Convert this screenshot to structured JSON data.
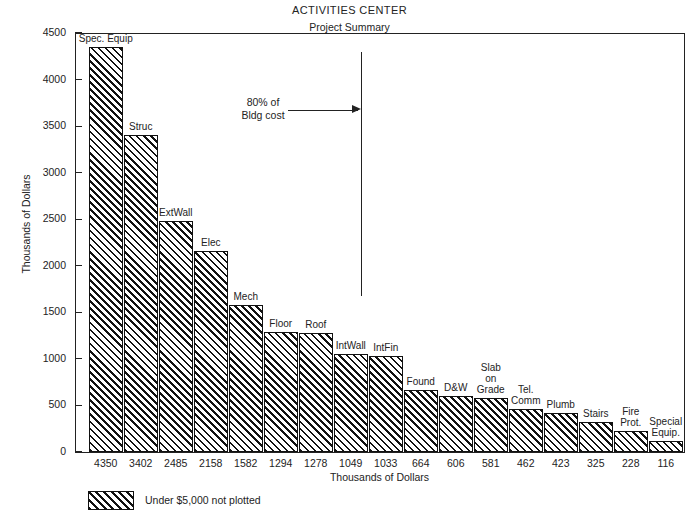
{
  "chart_data": {
    "type": "bar",
    "title": "ACTIVITIES CENTER",
    "subtitle": "Project Summary",
    "xlabel": "Thousands of Dollars",
    "ylabel": "Thousands of Dollars",
    "ylim": [
      0,
      4500
    ],
    "ytick_labels": [
      "4500",
      "4000",
      "3500",
      "3000",
      "2500",
      "2000",
      "1500",
      "1000",
      "500",
      "0"
    ],
    "ytick_values": [
      4500,
      4000,
      3500,
      3000,
      2500,
      2000,
      1500,
      1000,
      500,
      0
    ],
    "grid": false,
    "legend_position": "below-left",
    "categories": [
      "Spec. Equip",
      "Struc",
      "ExtWall",
      "Elec",
      "Mech",
      "Floor",
      "Roof",
      "IntWall",
      "IntFin",
      "Found",
      "D&W",
      "Slab on Grade",
      "Tel. Comm",
      "Plumb",
      "Stairs",
      "Fire Prot.",
      "Special Equip."
    ],
    "category_label_lines": [
      [
        "Spec. Equip"
      ],
      [
        "Struc"
      ],
      [
        "ExtWall"
      ],
      [
        "Elec"
      ],
      [
        "Mech"
      ],
      [
        "Floor"
      ],
      [
        "Roof"
      ],
      [
        "IntWall"
      ],
      [
        "IntFin"
      ],
      [
        "Found"
      ],
      [
        "D&W"
      ],
      [
        "Slab",
        "on",
        "Grade"
      ],
      [
        "Tel.",
        "Comm"
      ],
      [
        "Plumb"
      ],
      [
        "Stairs"
      ],
      [
        "Fire",
        "Prot."
      ],
      [
        "Special",
        "Equip."
      ]
    ],
    "values": [
      4350,
      3402,
      2485,
      2158,
      1582,
      1294,
      1278,
      1049,
      1033,
      664,
      606,
      581,
      462,
      423,
      325,
      228,
      116
    ],
    "value_labels": [
      "4350",
      "3402",
      "2485",
      "2158",
      "1582",
      "1294",
      "1278",
      "1049",
      "1033",
      "664",
      "606",
      "581",
      "462",
      "423",
      "325",
      "228",
      "116"
    ],
    "annotations": [
      {
        "text_lines": [
          "80% of",
          "Bldg cost"
        ],
        "text": "80% of Bldg cost",
        "points_to": "cumulative-80-percent-line"
      }
    ],
    "legend": [
      {
        "label": "Under $5,000 not plotted",
        "pattern": "diagonal-hatch"
      }
    ],
    "colors": {
      "bar_edge": "#111111",
      "bar_hatch": "#111111",
      "bar_fill": "#ffffff",
      "axis": "#222222",
      "text": "#232323"
    }
  },
  "annotation": {
    "line1": "80% of",
    "line2": "Bldg cost"
  },
  "legend": {
    "text": "Under $5,000 not plotted"
  },
  "caption": {
    "text": ""
  }
}
